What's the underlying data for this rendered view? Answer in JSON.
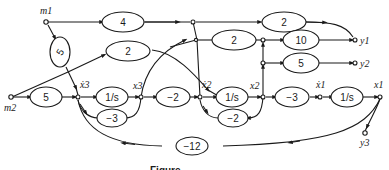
{
  "diagram": {
    "type": "signal-flow-graph",
    "caption": "Figure",
    "colors": {
      "stroke": "#1a1a1a",
      "background": "#ffffff"
    },
    "nodes": {
      "m1": "m1",
      "m2": "m2",
      "x3dot": "ẋ3",
      "x3": "x3",
      "x2dot": "ẋ2",
      "x2": "x2",
      "x1dot": "ẋ1",
      "x1": "x1",
      "y1": "y1",
      "y2": "y2",
      "y3": "y3"
    },
    "gains": {
      "m1_to_top": "4",
      "m1_to_x3dot": "5",
      "x3dot_upper": "2",
      "top_right": "2",
      "mid_upper": "2",
      "to_y1": "10",
      "to_y2": "5",
      "m2_to_x3dot": "5",
      "int3": "1/s",
      "fb3": "−3",
      "x3_to_x2dot": "−2",
      "int2": "1/s",
      "fb2": "−2",
      "x2_to_x1dot": "−3",
      "int1": "1/s",
      "fb_long": "−12"
    },
    "edges": [
      {
        "from": "m1",
        "to": "top-junction",
        "gain": "4"
      },
      {
        "from": "top-junction",
        "to": "y1",
        "gain": "2"
      },
      {
        "from": "m1",
        "to": "x3dot",
        "gain": "5"
      },
      {
        "from": "x3dot",
        "to": "x2dot",
        "gain": "2"
      },
      {
        "from": "x3",
        "to": "top-junction",
        "gain": "1"
      },
      {
        "from": "top-junction",
        "to": "x2dot",
        "gain": "1"
      },
      {
        "from": "mid-junction",
        "to": "y1-junction",
        "gain": "2"
      },
      {
        "from": "y1-junction",
        "to": "y1",
        "gain": "10"
      },
      {
        "from": "y2-junction",
        "to": "y2",
        "gain": "5"
      },
      {
        "from": "m2",
        "to": "x3dot",
        "gain": "5"
      },
      {
        "from": "x3dot",
        "to": "x3",
        "gain": "1/s"
      },
      {
        "from": "x3",
        "to": "x3dot",
        "gain": "−3"
      },
      {
        "from": "x3",
        "to": "x2dot",
        "gain": "−2"
      },
      {
        "from": "x2dot",
        "to": "x2",
        "gain": "1/s"
      },
      {
        "from": "x2",
        "to": "x2dot",
        "gain": "−2"
      },
      {
        "from": "x2",
        "to": "x1dot",
        "gain": "−3"
      },
      {
        "from": "x1dot",
        "to": "x1",
        "gain": "1/s"
      },
      {
        "from": "x1",
        "to": "y3",
        "gain": "1"
      },
      {
        "from": "x1",
        "to": "x3dot",
        "gain": "−12"
      }
    ]
  }
}
